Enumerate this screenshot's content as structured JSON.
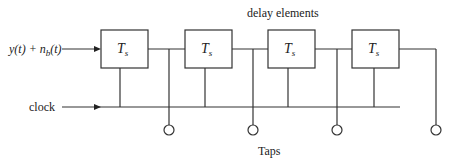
{
  "diagram": {
    "title": "delay elements",
    "input_label": "y(t) + n_b(t)",
    "input_parts": {
      "y": "y(t) + n",
      "sub": "b",
      "tail": "(t)"
    },
    "clock_label": "clock",
    "taps_label": "Taps",
    "delay_elements": [
      {
        "label": "T",
        "sub": "s"
      },
      {
        "label": "T",
        "sub": "s"
      },
      {
        "label": "T",
        "sub": "s"
      },
      {
        "label": "T",
        "sub": "s"
      }
    ],
    "tap_count": 4
  }
}
